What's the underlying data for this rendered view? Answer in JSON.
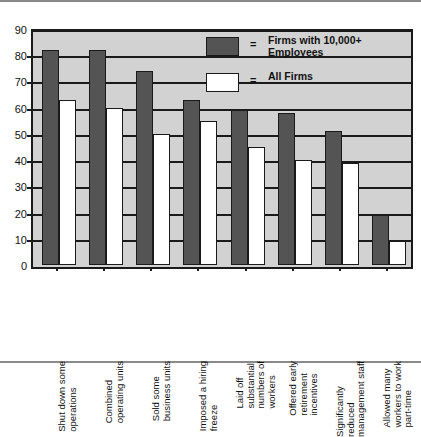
{
  "chart_data": {
    "type": "bar",
    "title": "",
    "subtitle": "",
    "xlabel": "",
    "ylabel": "",
    "ylim": [
      0,
      90
    ],
    "ytick_step": 10,
    "yticks": [
      0,
      10,
      20,
      30,
      40,
      50,
      60,
      70,
      80,
      90
    ],
    "grid": true,
    "legend_position": "top-right",
    "categories": [
      "Shut down some operations",
      "Combined operating units",
      "Sold some business units",
      "Imposed a hiring freeze",
      "Laid off substantial numbers of workers",
      "Offered early retirement incentives",
      "Significantly reduced management staff",
      "Allowed many workers to work part-time"
    ],
    "category_lines": [
      [
        "Shut down some",
        "operations"
      ],
      [
        "Combined",
        "operating units"
      ],
      [
        "Sold some",
        "business units"
      ],
      [
        "Imposed a hiring",
        "freeze"
      ],
      [
        "Laid off",
        "substantial",
        "numbers of",
        "workers"
      ],
      [
        "Offered early",
        "retirement",
        "incentives"
      ],
      [
        "Significantly",
        "reduced",
        "management staff"
      ],
      [
        "Allowed many",
        "workers to work",
        "part-time"
      ]
    ],
    "series": [
      {
        "name": "Firms with 10,000+ Employees",
        "color": "#545454",
        "values": [
          82,
          82,
          74,
          63,
          59,
          58,
          51,
          19
        ]
      },
      {
        "name": "All Firms",
        "color": "#ffffff",
        "values": [
          63,
          60,
          50,
          55,
          45,
          40,
          39,
          9
        ]
      }
    ]
  },
  "legend": {
    "equals": "=",
    "entries": [
      {
        "label_line1": "Firms with 10,000+",
        "label_line2": "Employees",
        "swatch": "dark"
      },
      {
        "label_line1": "All Firms",
        "label_line2": "",
        "swatch": "light"
      }
    ]
  },
  "colors": {
    "dark_bar": "#545454",
    "light_bar": "#ffffff",
    "plot_background": "#d2d2d2",
    "axis": "#1a1a1a",
    "frame": "#8a8a8a"
  }
}
